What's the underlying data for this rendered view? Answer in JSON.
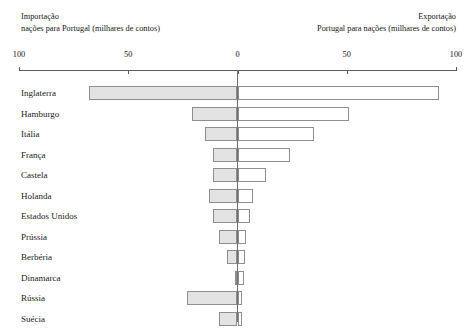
{
  "header": {
    "import_caption_title": "Importação",
    "import_caption_sub": "nações para Portugal (milhares de contos)",
    "export_caption_title": "Exportação",
    "export_caption_sub": "Portugal para nações (milhares de contos)"
  },
  "axis": {
    "ticks": [
      {
        "label": "100",
        "value": -100
      },
      {
        "label": "50",
        "value": -50
      },
      {
        "label": "0",
        "value": 0
      },
      {
        "label": "50",
        "value": 50
      },
      {
        "label": "100",
        "value": 100
      }
    ],
    "min": -100,
    "max": 100
  },
  "colors": {
    "import_fill": "#e3e3e3",
    "export_fill": "#ffffff",
    "bar_stroke": "#8e8e8e",
    "axis": "#5d5d5d",
    "text": "#1b1b1b"
  },
  "chart_data": {
    "type": "bar",
    "orientation": "horizontal",
    "subtype": "bidirectional-tornado",
    "title": "",
    "subtitle": "",
    "xlabel": "milhares de contos",
    "ylabel": "",
    "xlim": [
      -100,
      100
    ],
    "grid": false,
    "legend_position": "top",
    "axis_note": "Left axis direction = Importação (nações para Portugal); right axis direction = Exportação (Portugal para nações). Both sides labelled 100 / 50 / 0 / 50 / 100.",
    "categories": [
      "Inglaterra",
      "Hamburgo",
      "Itália",
      "França",
      "Castela",
      "Holanda",
      "Estados Unidos",
      "Prússia",
      "Berbéria",
      "Dinamarca",
      "Rússia",
      "Suécia"
    ],
    "series": [
      {
        "name": "Importação",
        "direction": "left",
        "values": [
          68,
          21,
          15,
          11,
          11,
          13,
          11,
          8.5,
          5,
          1,
          23,
          8.5
        ]
      },
      {
        "name": "Exportação",
        "direction": "right",
        "values": [
          92,
          51,
          35,
          24,
          13,
          7,
          5.5,
          4,
          3.5,
          3,
          2,
          2
        ]
      }
    ]
  },
  "rows": [
    {
      "label": "Inglaterra",
      "import": 68,
      "export": 92
    },
    {
      "label": "Hamburgo",
      "import": 21,
      "export": 51
    },
    {
      "label": "Itália",
      "import": 15,
      "export": 35
    },
    {
      "label": "França",
      "import": 11,
      "export": 24
    },
    {
      "label": "Castela",
      "import": 11,
      "export": 13
    },
    {
      "label": "Holanda",
      "import": 13,
      "export": 7
    },
    {
      "label": "Estados Unidos",
      "import": 11,
      "export": 5.5
    },
    {
      "label": "Prússia",
      "import": 8.5,
      "export": 4
    },
    {
      "label": "Berbéria",
      "import": 5,
      "export": 3.5
    },
    {
      "label": "Dinamarca",
      "import": 1,
      "export": 3
    },
    {
      "label": "Rússia",
      "import": 23,
      "export": 2
    },
    {
      "label": "Suécia",
      "import": 8.5,
      "export": 2
    }
  ]
}
